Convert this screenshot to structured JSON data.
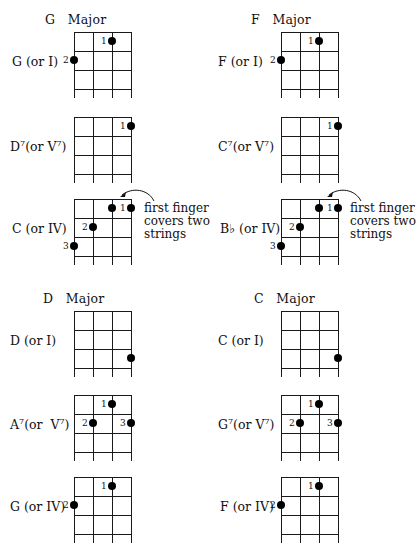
{
  "keys": [
    {
      "title": "G   Major",
      "chords": [
        {
          "name": "G",
          "label": "G (or I)",
          "sup": "",
          "dots": [
            {
              "string": 3,
              "fret": 1,
              "finger": "1"
            },
            {
              "string": 1,
              "fret": 2,
              "finger": "2"
            }
          ]
        },
        {
          "name": "D7",
          "label": "D",
          "sup": "7",
          "label_rest": "(or V",
          "label_sup2": "7",
          "label_end": ")",
          "dots": [
            {
              "string": 4,
              "fret": 1,
              "finger": "1"
            }
          ]
        },
        {
          "name": "C",
          "label": "C (or IV)",
          "sup": "",
          "dots": [
            {
              "string": 3,
              "fret": 1,
              "finger": "1"
            },
            {
              "string": 4,
              "fret": 1,
              "finger": ""
            },
            {
              "string": 2,
              "fret": 2,
              "finger": "2"
            },
            {
              "string": 1,
              "fret": 3,
              "finger": "3"
            }
          ],
          "note": "first finger\ncovers two\nstrings"
        }
      ]
    },
    {
      "title": "F   Major",
      "chords": [
        {
          "name": "F",
          "label": "F (or I)",
          "dots": [
            {
              "string": 3,
              "fret": 1,
              "finger": "1"
            },
            {
              "string": 1,
              "fret": 2,
              "finger": "2"
            }
          ]
        },
        {
          "name": "C7",
          "label": "C",
          "sup": "7",
          "label_rest": "(or V",
          "label_sup2": "7",
          "label_end": ")",
          "dots": [
            {
              "string": 4,
              "fret": 1,
              "finger": "1"
            }
          ]
        },
        {
          "name": "Bb",
          "label": "B♭ (or IV)",
          "dots": [
            {
              "string": 3,
              "fret": 1,
              "finger": "1"
            },
            {
              "string": 4,
              "fret": 1,
              "finger": ""
            },
            {
              "string": 2,
              "fret": 2,
              "finger": "2"
            },
            {
              "string": 1,
              "fret": 3,
              "finger": "3"
            }
          ],
          "note": "first finger\ncovers two\nstrings"
        }
      ]
    },
    {
      "title": "D   Major",
      "chords": [
        {
          "name": "D",
          "label": "D (or I)",
          "dots": [
            {
              "string": 4,
              "fret": 3,
              "finger": ""
            }
          ]
        },
        {
          "name": "A7",
          "label": "A",
          "sup": "7",
          "label_rest": "(or  V",
          "label_sup2": "7",
          "label_end": ")",
          "dots": [
            {
              "string": 3,
              "fret": 1,
              "finger": "1"
            },
            {
              "string": 2,
              "fret": 2,
              "finger": "2"
            },
            {
              "string": 4,
              "fret": 2,
              "finger": "3"
            }
          ]
        },
        {
          "name": "G",
          "label": "G (or IV)",
          "dots": [
            {
              "string": 3,
              "fret": 1,
              "finger": "1"
            },
            {
              "string": 1,
              "fret": 2,
              "finger": "2"
            }
          ]
        }
      ]
    },
    {
      "title": "C   Major",
      "chords": [
        {
          "name": "C",
          "label": "C (or I)",
          "dots": [
            {
              "string": 4,
              "fret": 3,
              "finger": ""
            }
          ]
        },
        {
          "name": "G7",
          "label": "G",
          "sup": "7",
          "label_rest": "(or V",
          "label_sup2": "7",
          "label_end": ")",
          "dots": [
            {
              "string": 3,
              "fret": 1,
              "finger": "1"
            },
            {
              "string": 2,
              "fret": 2,
              "finger": "2"
            },
            {
              "string": 4,
              "fret": 2,
              "finger": "3"
            }
          ]
        },
        {
          "name": "F",
          "label": "F (or IV)",
          "dots": [
            {
              "string": 3,
              "fret": 1,
              "finger": "1"
            },
            {
              "string": 1,
              "fret": 2,
              "finger": "2"
            }
          ]
        }
      ]
    }
  ]
}
